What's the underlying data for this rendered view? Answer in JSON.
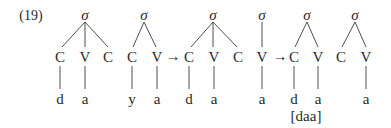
{
  "example_number": "(19)",
  "arrow": "→",
  "trees": [
    {
      "root": "σ",
      "skeleton": [
        "C",
        "V",
        "C"
      ],
      "segments": [
        "d",
        "a",
        ""
      ]
    },
    {
      "root": "σ",
      "skeleton": [
        "C",
        "V"
      ],
      "segments": [
        "y",
        "a"
      ]
    },
    {
      "root": "σ",
      "skeleton": [
        "C",
        "V",
        "C"
      ],
      "segments": [
        "d",
        "a",
        ""
      ]
    },
    {
      "root": "σ",
      "skeleton": [
        "V"
      ],
      "segments": [
        "a"
      ]
    },
    {
      "root": "σ",
      "skeleton": [
        "C",
        "V"
      ],
      "segments": [
        "d",
        "a"
      ]
    },
    {
      "root": "σ",
      "skeleton": [
        "C",
        "V"
      ],
      "segments": [
        "",
        "a"
      ]
    }
  ],
  "output_transcription": "[daa]"
}
